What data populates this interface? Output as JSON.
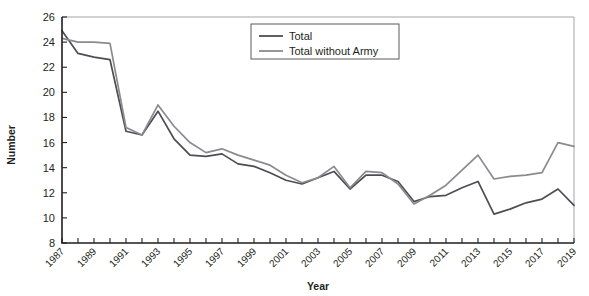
{
  "chart_data": {
    "type": "line",
    "title": "",
    "xlabel": "Year",
    "ylabel": "Number",
    "xlim": [
      1987,
      2019
    ],
    "ylim": [
      8,
      26
    ],
    "ytick_step": 2,
    "yticks": [
      8,
      10,
      12,
      14,
      16,
      18,
      20,
      22,
      24,
      26
    ],
    "xtick_labels": [
      "1987",
      "1989",
      "1991",
      "1993",
      "1995",
      "1997",
      "1999",
      "2001",
      "2003",
      "2005",
      "2007",
      "2009",
      "2011",
      "2013",
      "2015",
      "2017",
      "2019"
    ],
    "xtick_step": 2,
    "minor_xticks_every": 1,
    "grid": false,
    "legend_position": "top-center",
    "x": [
      1987,
      1988,
      1989,
      1990,
      1991,
      1992,
      1993,
      1994,
      1995,
      1996,
      1997,
      1998,
      1999,
      2000,
      2001,
      2002,
      2003,
      2004,
      2005,
      2006,
      2007,
      2008,
      2009,
      2010,
      2011,
      2012,
      2013,
      2014,
      2015,
      2016,
      2017,
      2018,
      2019
    ],
    "series": [
      {
        "name": "Total",
        "color": "#4d4d54",
        "values": [
          24.9,
          23.1,
          22.8,
          22.6,
          16.9,
          16.6,
          18.5,
          16.3,
          15.0,
          14.9,
          15.1,
          14.3,
          14.1,
          13.6,
          13.0,
          12.7,
          13.2,
          13.7,
          12.3,
          13.4,
          13.4,
          12.9,
          11.3,
          11.7,
          11.8,
          12.4,
          12.9,
          10.3,
          10.7,
          11.2,
          11.5,
          12.3,
          11.0
        ]
      },
      {
        "name": "Total without Army",
        "color": "#8a8a90",
        "values": [
          24.3,
          24.0,
          24.0,
          23.9,
          17.2,
          16.6,
          19.0,
          17.3,
          16.0,
          15.2,
          15.5,
          15.0,
          14.6,
          14.2,
          13.4,
          12.8,
          13.2,
          14.1,
          12.4,
          13.7,
          13.6,
          12.7,
          11.1,
          11.8,
          12.6,
          13.8,
          15.0,
          13.1,
          13.3,
          13.4,
          13.6,
          16.0,
          15.7
        ]
      }
    ],
    "legend": [
      {
        "label": "Total",
        "color": "#4d4d54"
      },
      {
        "label": "Total without Army",
        "color": "#8a8a90"
      }
    ]
  }
}
